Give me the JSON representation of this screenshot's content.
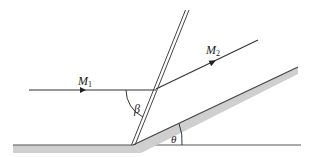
{
  "diagram": {
    "labels": {
      "upstream_mach": "M",
      "upstream_mach_sub": "1",
      "downstream_mach": "M",
      "downstream_mach_sub": "2",
      "shock_angle": "β",
      "wedge_angle": "θ"
    },
    "colors": {
      "line": "#333333",
      "surface_fill": "#cfcfcf",
      "background": "#ffffff"
    },
    "elements": [
      {
        "name": "upstream-streamline",
        "desc": "horizontal flow line with arrow, labeled M1"
      },
      {
        "name": "oblique-shock",
        "desc": "double line inclined at angle beta to incoming flow"
      },
      {
        "name": "downstream-streamline",
        "desc": "flow line parallel to wedge with arrow, labeled M2"
      },
      {
        "name": "wedge-surface",
        "desc": "inclined shaded wall at angle theta"
      },
      {
        "name": "floor-surface",
        "desc": "horizontal shaded wall ahead of wedge"
      },
      {
        "name": "beta-arc",
        "desc": "angle between incoming flow and shock"
      },
      {
        "name": "theta-arc",
        "desc": "wedge deflection angle"
      }
    ]
  }
}
